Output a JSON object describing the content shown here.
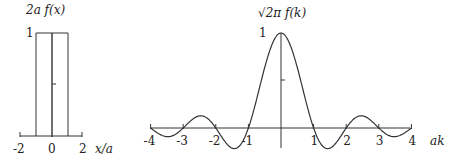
{
  "chart_data": [
    {
      "type": "line",
      "title": "",
      "ylabel": "2a f(x)",
      "xlabel": "x/a",
      "x_ticks": [
        "-2",
        "0",
        "2"
      ],
      "y_ticks": [
        "1"
      ],
      "xlim": [
        -2,
        2
      ],
      "ylim": [
        0,
        1
      ],
      "series": [
        {
          "name": "2a f(x)",
          "x": [
            -2,
            -1,
            -1,
            1,
            1,
            2
          ],
          "y": [
            0,
            0,
            1,
            1,
            0,
            0
          ]
        }
      ]
    },
    {
      "type": "line",
      "title": "",
      "ylabel": "√2π f(k)",
      "xlabel": "ak",
      "x_ticks": [
        "-4",
        "-3",
        "-2",
        "-1",
        "1",
        "2",
        "3",
        "4"
      ],
      "y_ticks": [
        "1"
      ],
      "xlim": [
        -4,
        4
      ],
      "ylim": [
        -0.22,
        1
      ],
      "series": [
        {
          "name": "sinc",
          "x": [
            -4,
            -3.5,
            -3,
            -2.5,
            -2,
            -1.43,
            -1,
            -0.5,
            0,
            0.5,
            1,
            1.43,
            2,
            2.5,
            3,
            3.5,
            4
          ],
          "y": [
            0,
            -0.09,
            0,
            0.127,
            0,
            -0.217,
            0,
            0.637,
            1,
            0.637,
            0,
            -0.217,
            0,
            0.127,
            0,
            -0.09,
            0
          ]
        }
      ]
    }
  ],
  "left": {
    "ylabel": "2a f(x)",
    "y_tick": "1",
    "x_ticks": [
      "-2",
      "0",
      "2"
    ],
    "xlabel": "x/a"
  },
  "right": {
    "ylabel": "√2π f(k)",
    "y_tick": "1",
    "x_ticks": [
      "-4",
      "-3",
      "-2",
      "-1",
      "1",
      "2",
      "3",
      "4"
    ],
    "xlabel": "ak"
  }
}
